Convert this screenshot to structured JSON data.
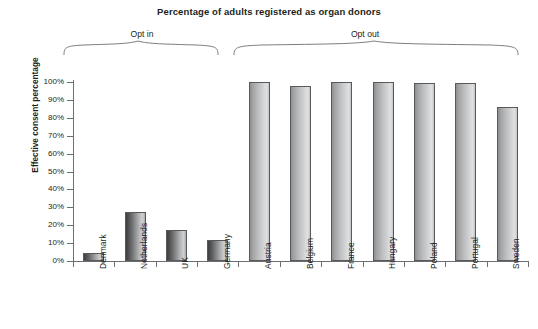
{
  "chart_data": {
    "type": "bar",
    "title": "Percentage of adults registered as organ donors",
    "xlabel": "",
    "ylabel": "Effective consent percentage",
    "ylim": [
      0,
      100
    ],
    "grid": false,
    "legend": "none",
    "y_ticks": [
      "0%",
      "10%",
      "20%",
      "30%",
      "40%",
      "50%",
      "60%",
      "70%",
      "80%",
      "90%",
      "100%"
    ],
    "y_tick_values": [
      0,
      10,
      20,
      30,
      40,
      50,
      60,
      70,
      80,
      90,
      100
    ],
    "categories": [
      "Denmark",
      "Netherlands",
      "UK",
      "Germany",
      "Austria",
      "Belgium",
      "France",
      "Hungary",
      "Poland",
      "Portugal",
      "Sweden"
    ],
    "values": [
      4.25,
      27.5,
      17.17,
      12,
      99.98,
      98,
      99.91,
      99.97,
      99.5,
      99.64,
      85.9
    ],
    "groups": [
      {
        "label": "Opt in",
        "categories": [
          "Denmark",
          "Netherlands",
          "UK",
          "Germany"
        ]
      },
      {
        "label": "Opt out",
        "categories": [
          "Austria",
          "Belgium",
          "France",
          "Hungary",
          "Poland",
          "Portugal",
          "Sweden"
        ]
      }
    ],
    "series": [
      {
        "name": "Effective consent percentage",
        "values": [
          4.25,
          27.5,
          17.17,
          12,
          99.98,
          98,
          99.91,
          99.97,
          99.5,
          99.64,
          85.9
        ]
      }
    ],
    "colors": {
      "opt_in_bar": "#8d8e90",
      "opt_out_bar": "#bcbdbf",
      "bar_outline": "#58595b",
      "axis": "#6d6e71",
      "text": "#231f20",
      "background": "#ffffff"
    }
  }
}
